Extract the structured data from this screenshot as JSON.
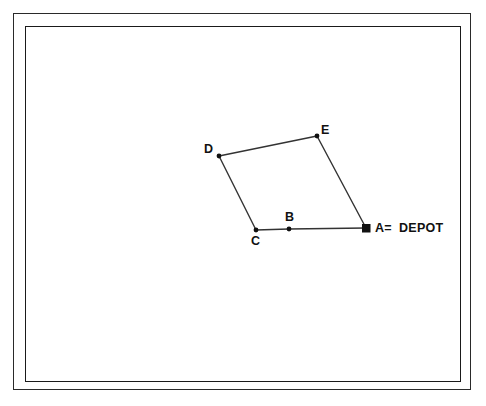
{
  "diagram": {
    "background_color": "#ffffff",
    "line_color": "#333333",
    "marker_color": "#111111",
    "frame": {
      "style": "double-rule",
      "outer_color": "#2a2a2a",
      "inner_color": "#1a1a1a"
    },
    "nodes": [
      {
        "id": "A",
        "label": "A",
        "x": 366,
        "y": 228,
        "marker": "filled-square",
        "role": "depot"
      },
      {
        "id": "B",
        "label": "B",
        "x": 289,
        "y": 229,
        "marker": "filled-dot",
        "role": "customer"
      },
      {
        "id": "C",
        "label": "C",
        "x": 256,
        "y": 230,
        "marker": "filled-dot",
        "role": "customer"
      },
      {
        "id": "D",
        "label": "D",
        "x": 219,
        "y": 156,
        "marker": "filled-dot",
        "role": "customer"
      },
      {
        "id": "E",
        "label": "E",
        "x": 317,
        "y": 136,
        "marker": "filled-dot",
        "role": "customer"
      }
    ],
    "edges": [
      {
        "from": "A",
        "to": "B"
      },
      {
        "from": "B",
        "to": "C"
      },
      {
        "from": "C",
        "to": "D"
      },
      {
        "from": "D",
        "to": "E"
      },
      {
        "from": "E",
        "to": "A"
      }
    ],
    "legend": {
      "symbol": "filled-square",
      "key": "A=",
      "value": "DEPOT"
    }
  }
}
